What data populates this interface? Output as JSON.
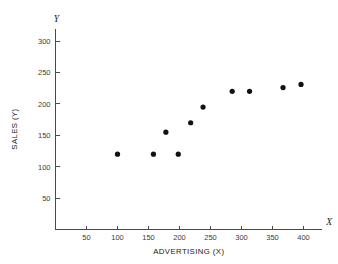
{
  "chart_data": {
    "type": "scatter",
    "title": "",
    "xlabel": "ADVERTISING (X)",
    "ylabel": "SALES (Y)",
    "x_axis_symbol": "X",
    "y_axis_symbol": "Y",
    "xlim": [
      0,
      430
    ],
    "ylim": [
      0,
      320
    ],
    "xticks": [
      50,
      100,
      150,
      200,
      250,
      300,
      350,
      400
    ],
    "yticks": [
      50,
      100,
      150,
      200,
      250,
      300
    ],
    "xtick_labels": [
      "50",
      "100",
      "150",
      "200",
      "250",
      "300",
      "350",
      "400"
    ],
    "ytick_labels": [
      "50",
      "100",
      "150",
      "200",
      "250",
      "300"
    ],
    "grid": false,
    "legend": null,
    "marker": "filled-circle",
    "marker_color": "#111111",
    "points": [
      {
        "x": 100,
        "y": 120
      },
      {
        "x": 158,
        "y": 120
      },
      {
        "x": 178,
        "y": 155
      },
      {
        "x": 198,
        "y": 120
      },
      {
        "x": 218,
        "y": 170
      },
      {
        "x": 238,
        "y": 195
      },
      {
        "x": 285,
        "y": 220
      },
      {
        "x": 313,
        "y": 220
      },
      {
        "x": 367,
        "y": 226
      },
      {
        "x": 396,
        "y": 231
      }
    ]
  }
}
